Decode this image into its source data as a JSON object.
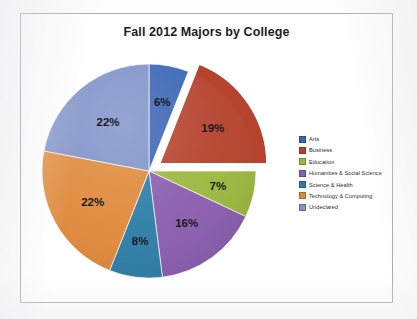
{
  "frame": {
    "border_color": "#a9a9ad",
    "background": "#ffffff"
  },
  "chart_data": {
    "type": "pie",
    "title": "Fall 2012 Majors by College",
    "xlabel": "",
    "ylabel": "",
    "grid": false,
    "legend_position": "right",
    "exploded_slices": [
      "Business"
    ],
    "start_angle_deg": 0,
    "direction": "clockwise",
    "categories": [
      "Arts",
      "Business",
      "Education",
      "Humanities & Social Science",
      "Science & Health",
      "Technology & Computing",
      "Undeclared"
    ],
    "values": [
      6,
      19,
      7,
      16,
      8,
      22,
      22
    ],
    "value_labels": [
      "6%",
      "19%",
      "7%",
      "16%",
      "8%",
      "22%",
      "22%"
    ],
    "colors": [
      "#3b65b5",
      "#b5432e",
      "#9cb83f",
      "#8b5fb0",
      "#2f7fa8",
      "#e08a3c",
      "#8092c8"
    ],
    "total": 100,
    "units": "percent"
  },
  "legend": {
    "items": [
      {
        "label": "Arts",
        "color": "#3b65b5"
      },
      {
        "label": "Business",
        "color": "#b5432e"
      },
      {
        "label": "Education",
        "color": "#9cb83f"
      },
      {
        "label": "Humanities & Social Science",
        "color": "#8b5fb0"
      },
      {
        "label": "Science & Health",
        "color": "#2f7fa8"
      },
      {
        "label": "Technology & Computing",
        "color": "#e08a3c"
      },
      {
        "label": "Undeclared",
        "color": "#8092c8"
      }
    ]
  }
}
